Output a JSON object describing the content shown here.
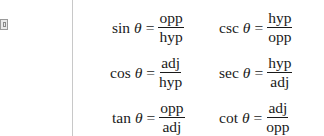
{
  "left_column": [
    {
      "fn": "sin",
      "var": "θ",
      "eq": "=",
      "numerator": "opp",
      "denominator": "hyp"
    },
    {
      "fn": "cos",
      "var": "θ",
      "eq": "=",
      "numerator": "adj",
      "denominator": "hyp"
    },
    {
      "fn": "tan",
      "var": "θ",
      "eq": "=",
      "numerator": "opp",
      "denominator": "adj"
    }
  ],
  "right_column": [
    {
      "fn": "csc",
      "var": "θ",
      "eq": "=",
      "numerator": "hyp",
      "denominator": "opp"
    },
    {
      "fn": "sec",
      "var": "θ",
      "eq": "=",
      "numerator": "hyp",
      "denominator": "adj"
    },
    {
      "fn": "cot",
      "var": "θ",
      "eq": "=",
      "numerator": "adj",
      "denominator": "opp"
    }
  ]
}
